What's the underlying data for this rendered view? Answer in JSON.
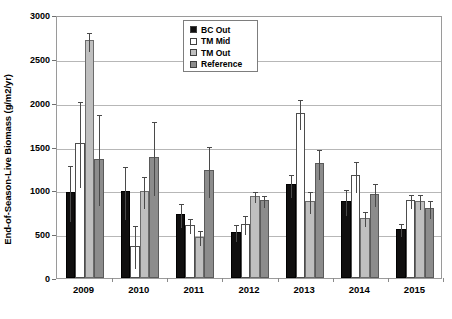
{
  "chart_data": {
    "type": "bar",
    "title": "",
    "xlabel": "",
    "ylabel": "End-of-Season-Live Biomass (g/m2/yr)",
    "categories": [
      "2009",
      "2010",
      "2011",
      "2012",
      "2013",
      "2014",
      "2015"
    ],
    "ylim": [
      0,
      3000
    ],
    "yticks": [
      0,
      500,
      1000,
      1500,
      2000,
      2500,
      3000
    ],
    "ytick_labels": [
      "0",
      "500",
      "1000",
      "1500",
      "2000",
      "2500",
      "3000"
    ],
    "grid": true,
    "legend_position": "top-center",
    "series": [
      {
        "name": "BC Out",
        "color": "#100f0f",
        "values": [
          980,
          990,
          730,
          530,
          1070,
          880,
          560
        ],
        "errors": [
          320,
          300,
          135,
          95,
          130,
          150,
          75
        ]
      },
      {
        "name": "TM Mid",
        "color": "#ffffff",
        "values": [
          1540,
          370,
          610,
          620,
          1880,
          1170,
          890
        ],
        "errors": [
          490,
          250,
          90,
          110,
          170,
          175,
          85
        ]
      },
      {
        "name": "TM Out",
        "color": "#bfbfbf",
        "values": [
          2710,
          990,
          470,
          940,
          880,
          690,
          880
        ],
        "errors": [
          105,
          185,
          85,
          60,
          125,
          90,
          85
        ]
      },
      {
        "name": "Reference",
        "color": "#8c8c8c",
        "values": [
          1360,
          1380,
          1230,
          890,
          1310,
          960,
          800
        ],
        "errors": [
          520,
          420,
          290,
          70,
          170,
          130,
          100
        ]
      }
    ]
  },
  "legend": {
    "items": [
      {
        "label": "BC Out"
      },
      {
        "label": "TM Mid"
      },
      {
        "label": "TM Out"
      },
      {
        "label": "Reference"
      }
    ]
  }
}
